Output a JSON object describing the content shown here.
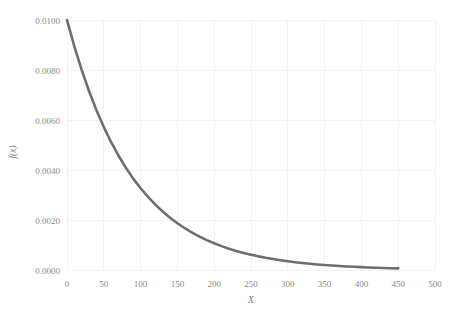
{
  "chart_data": {
    "type": "line",
    "title": "",
    "subtitle": "",
    "xlabel": "X",
    "ylabel": "f(x)",
    "xlim": [
      0,
      500
    ],
    "ylim": [
      0.0,
      0.01
    ],
    "grid": true,
    "legend": null,
    "legend_position": "none",
    "line_color": "#6e6e6e",
    "grid_color": "#f2f2f2",
    "tick_color": "#8a8a8a",
    "background_color": "#ffffff",
    "xticks": [
      0,
      50,
      100,
      150,
      200,
      250,
      300,
      350,
      400,
      450,
      500
    ],
    "xticklabels": [
      "0",
      "50",
      "100",
      "150",
      "200",
      "250",
      "300",
      "350",
      "400",
      "450",
      "500"
    ],
    "yticks": [
      0.0,
      0.002,
      0.004,
      0.006,
      0.008,
      0.01
    ],
    "yticklabels": [
      "0.0000",
      "0.0020",
      "0.0040",
      "0.0060",
      "0.0080",
      "0.0100"
    ],
    "series": [
      {
        "name": "f(x)",
        "x": [
          0,
          10,
          20,
          30,
          40,
          50,
          60,
          70,
          80,
          90,
          100,
          110,
          120,
          130,
          140,
          150,
          160,
          170,
          180,
          190,
          200,
          210,
          220,
          230,
          240,
          250,
          260,
          270,
          280,
          290,
          300,
          310,
          320,
          330,
          340,
          350,
          360,
          370,
          380,
          390,
          400,
          410,
          420,
          430,
          440,
          450
        ],
        "values": [
          0.01,
          0.008942,
          0.007996,
          0.00715,
          0.006394,
          0.005717,
          0.005112,
          0.004571,
          0.004088,
          0.003655,
          0.003269,
          0.002923,
          0.002614,
          0.002337,
          0.00209,
          0.001869,
          0.001671,
          0.001494,
          0.001336,
          0.001195,
          0.001068,
          0.000955,
          0.000854,
          0.000764,
          0.000683,
          0.000611,
          0.000546,
          0.000488,
          0.000437,
          0.00039,
          0.000349,
          0.000312,
          0.000279,
          0.00025,
          0.000223,
          0.0002,
          0.000179,
          0.00016,
          0.000143,
          0.000128,
          0.000114,
          0.000102,
          9.1e-05,
          8.2e-05,
          7.3e-05,
          6.5e-05
        ]
      }
    ],
    "function_form": "f(x) = 0.01 * exp(-x / 89)",
    "x_range_drawn": [
      0,
      450
    ]
  },
  "axes": {
    "x_axis_title": "X",
    "y_axis_title": "f(x)"
  }
}
